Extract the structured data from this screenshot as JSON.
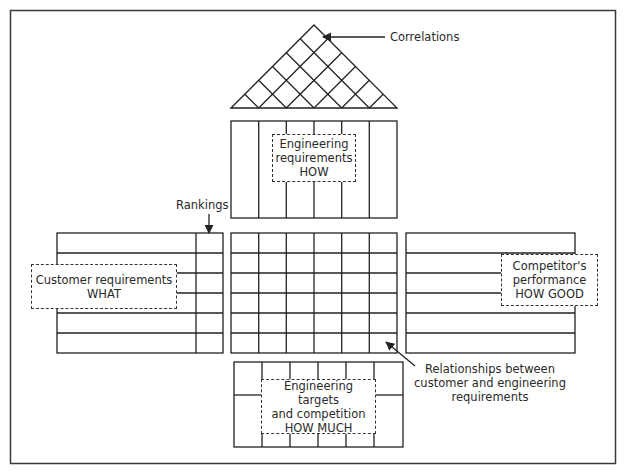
{
  "diagram": {
    "colors": {
      "line": "#2b2b2b",
      "background": "#ffffff",
      "frame": "#3a3a3a"
    },
    "labels": {
      "correlations": "Correlations",
      "rankings": "Rankings",
      "relationships": [
        "Relationships between",
        "customer and engineering",
        "requirements"
      ]
    },
    "boxes": {
      "engineering_requirements": [
        "Engineering",
        "requirements",
        "HOW"
      ],
      "customer_requirements": [
        "Customer requirements",
        "WHAT"
      ],
      "competitors_performance": [
        "Competitor's",
        "performance",
        "HOW GOOD"
      ],
      "engineering_targets": [
        "Engineering targets",
        "and competition",
        "HOW MUCH"
      ]
    },
    "structure": {
      "roof_triangle": {
        "grid": "diagonal lattice",
        "divisions": 6
      },
      "engineering_requirements_columns": 6,
      "relationship_matrix": {
        "rows": 6,
        "columns": 6
      },
      "customer_requirements_rows": 6,
      "rankings_column": 1,
      "competitor_rows": 6,
      "targets_columns": 6
    }
  }
}
